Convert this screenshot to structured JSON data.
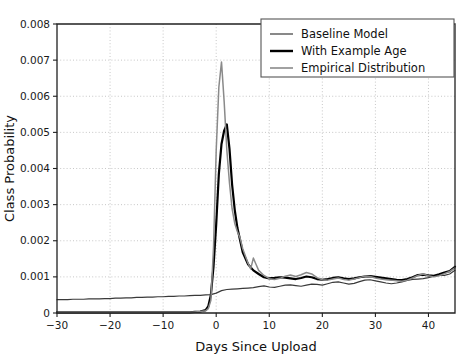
{
  "figure": {
    "background_color": "#ffffff",
    "axes_color": "#202020",
    "grid_color": "#b9b9b9"
  },
  "chart_data": {
    "type": "line",
    "title": "",
    "xlabel": "Days Since Upload",
    "ylabel": "Class Probability",
    "xlim": [
      -30,
      45
    ],
    "ylim": [
      0,
      0.008
    ],
    "grid": true,
    "grid_style": "dotted",
    "xticks": [
      -30,
      -20,
      -10,
      0,
      10,
      20,
      30,
      40
    ],
    "xtick_labels": [
      "−30",
      "−20",
      "−10",
      "0",
      "10",
      "20",
      "30",
      "40"
    ],
    "yticks": [
      0,
      0.001,
      0.002,
      0.003,
      0.004,
      0.005,
      0.006,
      0.007,
      0.008
    ],
    "ytick_labels": [
      "0",
      "0.001",
      "0.002",
      "0.003",
      "0.004",
      "0.005",
      "0.006",
      "0.007",
      "0.008"
    ],
    "legend": {
      "position": "upper right",
      "entries": [
        {
          "name": "Baseline Model",
          "color": "#3a3a3a",
          "width": 1.2
        },
        {
          "name": "With Example Age",
          "color": "#000000",
          "width": 2.4
        },
        {
          "name": "Empirical Distribution",
          "color": "#8a8a8a",
          "width": 1.6
        }
      ]
    },
    "series": [
      {
        "name": "Baseline Model",
        "color": "#3a3a3a",
        "width": 1.2,
        "x": [
          -30,
          -29,
          -28,
          -27,
          -26,
          -25,
          -24,
          -23,
          -22,
          -21,
          -20,
          -19,
          -18,
          -17,
          -16,
          -15,
          -14,
          -13,
          -12,
          -11,
          -10,
          -9,
          -8,
          -7,
          -6,
          -5,
          -4,
          -3,
          -2,
          -1,
          0,
          1,
          2,
          3,
          4,
          5,
          6,
          7,
          8,
          9,
          10,
          11,
          12,
          13,
          14,
          15,
          16,
          17,
          18,
          19,
          20,
          21,
          22,
          23,
          24,
          25,
          26,
          27,
          28,
          29,
          30,
          31,
          32,
          33,
          34,
          35,
          36,
          37,
          38,
          39,
          40,
          41,
          42,
          43,
          44,
          45
        ],
        "y": [
          0.00037,
          0.00037,
          0.00037,
          0.00038,
          0.00038,
          0.00038,
          0.00039,
          0.00039,
          0.00039,
          0.0004,
          0.0004,
          0.00041,
          0.00041,
          0.00042,
          0.00042,
          0.00043,
          0.00043,
          0.00044,
          0.00044,
          0.00045,
          0.00045,
          0.00046,
          0.00046,
          0.00047,
          0.00047,
          0.00048,
          0.00049,
          0.00049,
          0.0005,
          0.00051,
          0.00055,
          0.00062,
          0.00065,
          0.00066,
          0.00067,
          0.00068,
          0.00069,
          0.0007,
          0.00073,
          0.00075,
          0.00072,
          0.00071,
          0.00074,
          0.00077,
          0.00078,
          0.00076,
          0.00074,
          0.00077,
          0.0008,
          0.00079,
          0.00077,
          0.00081,
          0.00085,
          0.00086,
          0.00083,
          0.0008,
          0.00082,
          0.00087,
          0.00091,
          0.00092,
          0.00089,
          0.00086,
          0.00083,
          0.00081,
          0.00083,
          0.00086,
          0.0009,
          0.00093,
          0.00094,
          0.00095,
          0.00098,
          0.00102,
          0.00105,
          0.00104,
          0.00108,
          0.00118
        ]
      },
      {
        "name": "With Example Age",
        "color": "#000000",
        "width": 2.2,
        "x": [
          -30,
          -28,
          -26,
          -24,
          -22,
          -20,
          -18,
          -16,
          -14,
          -12,
          -10,
          -8,
          -6,
          -5,
          -4,
          -3,
          -2,
          -1.5,
          -1,
          -0.5,
          0,
          0.5,
          1,
          1.5,
          2,
          2.5,
          3,
          3.5,
          4,
          5,
          6,
          7,
          8,
          9,
          10,
          11,
          12,
          13,
          14,
          15,
          16,
          17,
          18,
          19,
          20,
          21,
          22,
          23,
          24,
          25,
          26,
          27,
          28,
          29,
          30,
          31,
          32,
          33,
          34,
          35,
          36,
          37,
          38,
          39,
          40,
          41,
          42,
          43,
          44,
          45
        ],
        "y": [
          2e-05,
          2e-05,
          2e-05,
          2e-05,
          2e-05,
          2e-05,
          2e-05,
          2e-05,
          2e-05,
          2e-05,
          2e-05,
          2e-05,
          2e-05,
          2e-05,
          3e-05,
          4e-05,
          8e-05,
          0.00018,
          0.0005,
          0.0013,
          0.00245,
          0.00385,
          0.00468,
          0.00505,
          0.00522,
          0.00455,
          0.00355,
          0.00285,
          0.00235,
          0.00168,
          0.00135,
          0.00118,
          0.00108,
          0.00099,
          0.00096,
          0.00097,
          0.00099,
          0.00098,
          0.00096,
          0.00094,
          0.00097,
          0.00101,
          0.00099,
          0.00094,
          0.00092,
          0.00094,
          0.00097,
          0.00099,
          0.00096,
          0.00094,
          0.00096,
          0.00099,
          0.00101,
          0.00102,
          0.001,
          0.00098,
          0.00096,
          0.00094,
          0.00092,
          0.00091,
          0.00094,
          0.00099,
          0.00105,
          0.00106,
          0.00104,
          0.00103,
          0.00107,
          0.00112,
          0.00116,
          0.00128
        ]
      },
      {
        "name": "Empirical Distribution",
        "color": "#8a8a8a",
        "width": 1.5,
        "x": [
          -30,
          -28,
          -26,
          -24,
          -22,
          -20,
          -18,
          -16,
          -14,
          -12,
          -10,
          -8,
          -6,
          -5,
          -4,
          -3,
          -2,
          -1.5,
          -1,
          -0.5,
          0,
          0.5,
          1,
          1.5,
          2,
          2.5,
          3,
          3.5,
          4,
          4.5,
          5,
          5.5,
          6,
          6.5,
          7,
          7.5,
          8,
          9,
          10,
          11,
          12,
          13,
          14,
          15,
          16,
          17,
          18,
          19,
          20,
          21,
          22,
          23,
          24,
          25,
          26,
          27,
          28,
          29,
          30,
          31,
          32,
          33,
          34,
          35,
          36,
          37,
          38,
          39,
          40,
          41,
          42,
          43,
          44,
          45
        ],
        "y": [
          2e-05,
          2e-05,
          2e-05,
          2e-05,
          2e-05,
          2e-05,
          2e-05,
          2e-05,
          2e-05,
          2e-05,
          2e-05,
          2e-05,
          2e-05,
          2e-05,
          3e-05,
          4e-05,
          6e-05,
          0.00012,
          0.00035,
          0.00185,
          0.0045,
          0.00625,
          0.00695,
          0.00585,
          0.00452,
          0.0036,
          0.00288,
          0.00248,
          0.00225,
          0.00208,
          0.00178,
          0.00158,
          0.00138,
          0.00122,
          0.00152,
          0.00135,
          0.00118,
          0.00104,
          0.00095,
          0.00093,
          0.00096,
          0.00102,
          0.00105,
          0.00101,
          0.00106,
          0.00112,
          0.00108,
          0.00098,
          0.00092,
          0.00091,
          0.00094,
          0.00097,
          0.00093,
          0.00091,
          0.00094,
          0.00098,
          0.00102,
          0.00101,
          0.00097,
          0.00094,
          0.00092,
          0.00091,
          0.00089,
          0.00088,
          0.00091,
          0.00097,
          0.00104,
          0.00108,
          0.00103,
          0.001,
          0.00103,
          0.00109,
          0.00115,
          0.00125
        ]
      }
    ]
  }
}
